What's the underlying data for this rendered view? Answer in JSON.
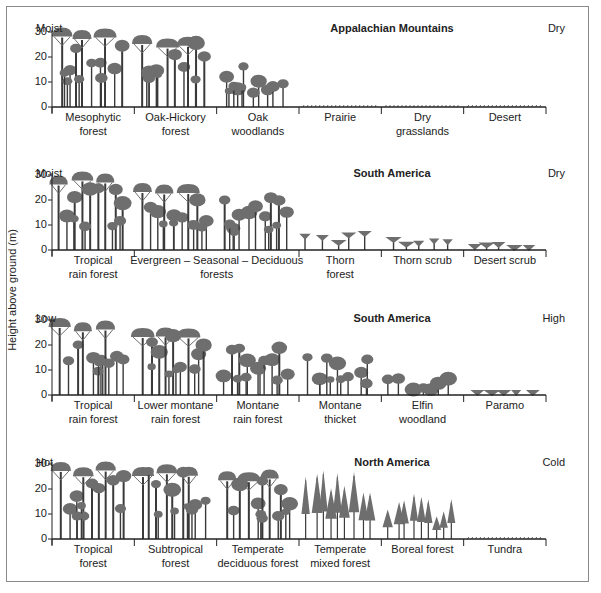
{
  "y_axis_label": "Height above ground (m)",
  "y_ticks": [
    "30",
    "20",
    "10",
    "0"
  ],
  "colors": {
    "canopy": "#6e6e6e",
    "trunk": "#3a3a3a",
    "axis": "#222222",
    "border": "#8a8a8a"
  },
  "panels": [
    {
      "title": "Appalachian Mountains",
      "left_end": "Moist",
      "right_end": "Dry",
      "zones": [
        "Mesophytic\nforest",
        "Oak-Hickory\nforest",
        "Oak\nwoodlands",
        "Prairie",
        "Dry\ngrasslands",
        "Desert"
      ],
      "top": 22,
      "baseline": 107
    },
    {
      "title": "South America",
      "left_end": "Moist",
      "right_end": "Dry",
      "zones": [
        "Tropical\nrain forest",
        "Evergreen – Seasonal – Deciduous\nforests",
        "",
        "Thorn\nforest",
        "Thorn scrub",
        "Desert scrub"
      ],
      "top": 167,
      "baseline": 250
    },
    {
      "title": "South America",
      "left_end": "Low",
      "right_end": "High",
      "zones": [
        "Tropical\nrain forest",
        "Lower montane\nrain forest",
        "Montane\nrain forest",
        "Montane\nthicket",
        "Elfin\nwoodland",
        "Paramo"
      ],
      "top": 312,
      "baseline": 395
    },
    {
      "title": "North America",
      "left_end": "Hot",
      "right_end": "Cold",
      "zones": [
        "Tropical\nforest",
        "Subtropical\nforest",
        "Temperate\ndeciduous forest",
        "Temperate\nmixed forest",
        "Boreal forest",
        "Tundra"
      ],
      "top": 456,
      "baseline": 539
    }
  ],
  "chart_data": {
    "type": "diagram",
    "ylabel": "Height above ground (m)",
    "ylim": [
      0,
      30
    ],
    "profiles": [
      {
        "region": "Appalachian Mountains",
        "gradient": [
          "Moist",
          "Dry"
        ],
        "zones": [
          "Mesophytic forest",
          "Oak-Hickory forest",
          "Oak woodlands",
          "Prairie",
          "Dry grasslands",
          "Desert"
        ],
        "max_height_m": [
          32,
          30,
          18,
          1,
          1,
          1
        ]
      },
      {
        "region": "South America",
        "gradient": [
          "Moist",
          "Dry"
        ],
        "zones": [
          "Tropical rain forest",
          "Evergreen – Seasonal – Deciduous forests",
          "Thorn forest",
          "Thorn scrub",
          "Desert scrub"
        ],
        "max_height_m": [
          32,
          28,
          12,
          8,
          5
        ]
      },
      {
        "region": "South America",
        "gradient": [
          "Low",
          "High"
        ],
        "zones": [
          "Tropical rain forest",
          "Lower montane rain forest",
          "Montane rain forest",
          "Montane thicket",
          "Elfin woodland",
          "Paramo"
        ],
        "max_height_m": [
          32,
          28,
          22,
          17,
          10,
          3
        ]
      },
      {
        "region": "North America",
        "gradient": [
          "Hot",
          "Cold"
        ],
        "zones": [
          "Tropical forest",
          "Subtropical forest",
          "Temperate deciduous forest",
          "Temperate mixed forest",
          "Boreal forest",
          "Tundra"
        ],
        "max_height_m": [
          31,
          30,
          28,
          28,
          22,
          1
        ]
      }
    ]
  }
}
